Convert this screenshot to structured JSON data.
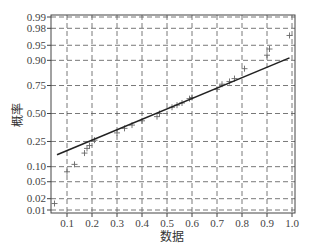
{
  "chart_data": {
    "type": "scatter",
    "title": "",
    "xlabel": "数据",
    "ylabel": "概率",
    "xlim": [
      0.04,
      1.01
    ],
    "y_scale": "normal-probability",
    "grid": true,
    "grid_style": "dashed",
    "x_ticks": [
      "0.1",
      "0.2",
      "0.3",
      "0.4",
      "0.5",
      "0.6",
      "0.7",
      "0.8",
      "0.9",
      "1.0"
    ],
    "y_ticks": [
      "0.99",
      "0.98",
      "0.95",
      "0.90",
      "0.75",
      "0.50",
      "0.25",
      "0.10",
      "0.05",
      "0.02",
      "0.01"
    ],
    "series": [
      {
        "name": "data",
        "marker": "+",
        "x": [
          0.05,
          0.1,
          0.13,
          0.17,
          0.18,
          0.19,
          0.21,
          0.3,
          0.33,
          0.36,
          0.4,
          0.46,
          0.47,
          0.52,
          0.54,
          0.56,
          0.59,
          0.6,
          0.7,
          0.72,
          0.75,
          0.77,
          0.81,
          0.9,
          0.91,
          0.99
        ],
        "y": [
          0.015,
          0.08,
          0.11,
          0.17,
          0.2,
          0.22,
          0.26,
          0.32,
          0.36,
          0.39,
          0.43,
          0.47,
          0.5,
          0.56,
          0.58,
          0.6,
          0.64,
          0.65,
          0.72,
          0.76,
          0.78,
          0.8,
          0.86,
          0.92,
          0.94,
          0.97
        ]
      },
      {
        "name": "reference line",
        "type": "line",
        "x": [
          0.06,
          0.99
        ],
        "y": [
          0.16,
          0.91
        ]
      }
    ]
  }
}
